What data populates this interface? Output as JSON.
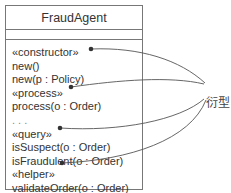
{
  "class": {
    "name": "FraudAgent",
    "attributes": [],
    "operations": [
      {
        "text": "«constructor»",
        "stereotype": true
      },
      {
        "text": "new()"
      },
      {
        "text": "new(p : Policy)"
      },
      {
        "text": "«process»",
        "stereotype": true
      },
      {
        "text": "process(o : Order)"
      },
      {
        "text": ". . ."
      },
      {
        "text": "«query»",
        "stereotype": true
      },
      {
        "text": "isSuspect(o : Order)"
      },
      {
        "text": "isFraudulent(o : Order)"
      },
      {
        "text": "«helper»",
        "stereotype": true
      },
      {
        "text": "validateOrder(o : Order)"
      }
    ]
  },
  "annotation": {
    "label": "衍型"
  },
  "colors": {
    "border": "#777777",
    "text": "#333333",
    "line": "#555555"
  }
}
